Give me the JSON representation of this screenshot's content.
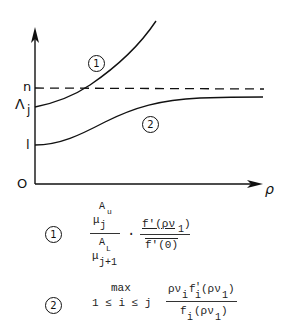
{
  "diagram": {
    "y_axis_labels": {
      "n": "n",
      "lambda_j_main": "Λ",
      "lambda_j_sub": "j",
      "one": "l",
      "origin": "O"
    },
    "x_axis_label": "ρ",
    "curves": [
      {
        "id": "1",
        "label": "1",
        "description": "increasing convex curve starting at Λj, crossing n"
      },
      {
        "id": "2",
        "label": "2",
        "description": "increasing curve starting at 1, asymptotic below n"
      }
    ],
    "dashed_line_label": "n"
  },
  "legend": {
    "item1": {
      "marker": "1",
      "num_mu": "μ",
      "num_sup": "A",
      "num_sup2": "u",
      "num_sub": "j",
      "den_sup": "A",
      "den_sup2": "L",
      "den_mu": "μ",
      "den_sub": "j+1",
      "dot": "·",
      "right_num": "f'(ρν",
      "right_num_sub": "1",
      "right_num_close": ")",
      "right_den": "f'(0)"
    },
    "item2": {
      "marker": "2",
      "max": "max",
      "range": "1 ≤ i ≤ j",
      "num_a": "ρν",
      "num_a_sub": "i",
      "num_b": "f",
      "num_b_sup": "'",
      "num_b_sub": "i",
      "num_c": "(ρν",
      "num_c_sub": "1",
      "num_c_close": ")",
      "den_a": "f",
      "den_a_sub": "i",
      "den_b": "(ρν",
      "den_b_sub": "1",
      "den_b_close": ")"
    }
  }
}
